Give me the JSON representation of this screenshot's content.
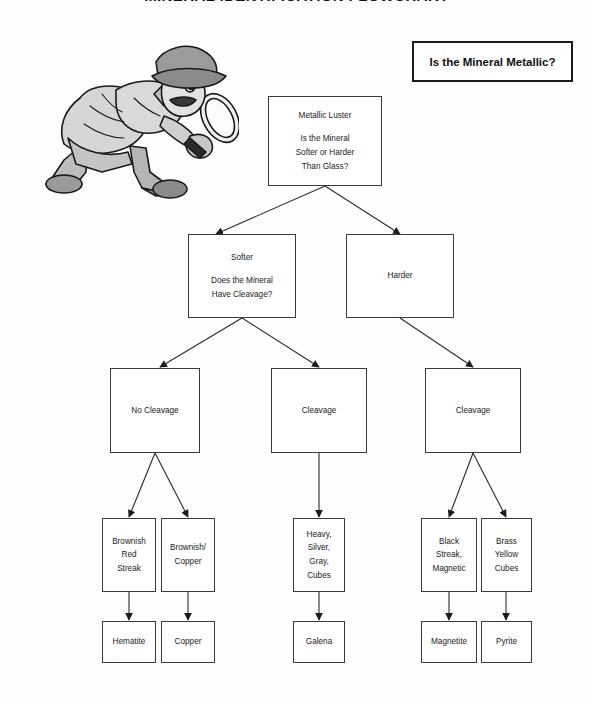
{
  "page": {
    "title_clipped": "MINERAL IDENTIFICATION FLOWCHART",
    "background_color": "#fefefe",
    "line_color": "#3a3a3a",
    "text_color": "#222222"
  },
  "header": {
    "question": "Is the Mineral Metallic?"
  },
  "illustration": {
    "name": "detective-with-magnifying-glass",
    "description": "Cartoon detective in deerstalker hat and trench coat holding a magnifying glass",
    "fill_light": "#d8d8d8",
    "fill_mid": "#a8a8a8",
    "fill_dark": "#6e6e6e",
    "outline": "#1a1a1a"
  },
  "nodes": {
    "root": {
      "line1": "Metallic Luster",
      "line2": "Is the Mineral",
      "line3": "Softer or Harder",
      "line4": "Than Glass?"
    },
    "softer": {
      "line1": "Softer",
      "line2": "Does the Mineral",
      "line3": "Have Cleavage?"
    },
    "harder": {
      "line1": "Harder"
    },
    "no_cleavage": {
      "line1": "No Cleavage"
    },
    "cleavage_mid": {
      "line1": "Cleavage"
    },
    "cleavage_right": {
      "line1": "Cleavage"
    },
    "brownish_red_streak": {
      "line1": "Brownish",
      "line2": "Red",
      "line3": "Streak"
    },
    "brownish_copper": {
      "line1": "Brownish/",
      "line2": "Copper"
    },
    "heavy_silver_gray_cubes": {
      "line1": "Heavy,",
      "line2": "Silver,",
      "line3": "Gray,",
      "line4": "Cubes"
    },
    "black_streak_magnetic": {
      "line1": "Black",
      "line2": "Streak,",
      "line3": "Magnetic"
    },
    "brass_yellow_cubes": {
      "line1": "Brass",
      "line2": "Yellow",
      "line3": "Cubes"
    },
    "hematite": {
      "line1": "Hematite"
    },
    "copper": {
      "line1": "Copper"
    },
    "galena": {
      "line1": "Galena"
    },
    "magnetite": {
      "line1": "Magnetite"
    },
    "pyrite": {
      "line1": "Pyrite"
    }
  }
}
